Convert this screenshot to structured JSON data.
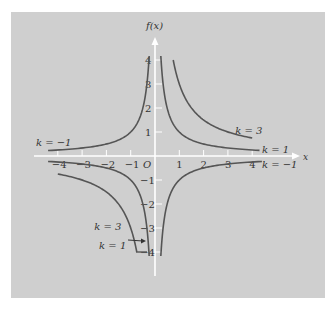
{
  "chart_data": {
    "type": "line",
    "title": "",
    "function": "f(x) = k/x",
    "xlabel": "x",
    "ylabel": "f(x)",
    "xlim": [
      -4.5,
      5.5
    ],
    "ylim": [
      -4.8,
      5.0
    ],
    "grid": false,
    "x_ticks": [
      -4,
      -3,
      -2,
      -1,
      1,
      2,
      3,
      4
    ],
    "x_tick_labels": [
      "−4",
      "−3",
      "−2",
      "−1",
      "1",
      "2",
      "3",
      "4"
    ],
    "y_ticks": [
      4,
      3,
      2,
      1,
      -1,
      -2,
      -3,
      -4
    ],
    "y_tick_labels": [
      "4",
      "3",
      "2",
      "1",
      "−1",
      "−2",
      "−3",
      "−4"
    ],
    "origin_label": "O",
    "series": [
      {
        "name": "k = 1",
        "k": 1,
        "branch": "x>0",
        "x_range": [
          0.24,
          4.3
        ]
      },
      {
        "name": "k = 3",
        "k": 3,
        "branch": "x>0",
        "x_range": [
          0.75,
          4.0
        ]
      },
      {
        "name": "k = -1",
        "k": -1,
        "branch": "x<0",
        "x_range": [
          -4.4,
          -0.24
        ]
      },
      {
        "name": "k = 1",
        "k": 1,
        "branch": "x<0",
        "x_range": [
          -4.4,
          -0.24
        ]
      },
      {
        "name": "k = 3",
        "k": 3,
        "branch": "x<0",
        "x_range": [
          -4.0,
          -0.75
        ]
      },
      {
        "name": "k = -1",
        "k": -1,
        "branch": "x>0",
        "x_range": [
          0.24,
          4.4
        ]
      }
    ],
    "annotations": [
      {
        "text": "k = −1",
        "x": -4.9,
        "y": 0.6
      },
      {
        "text": "k = 3",
        "x": 3.3,
        "y": 1.1
      },
      {
        "text": "k = 1",
        "x": 4.4,
        "y": 0.3
      },
      {
        "text": "k = −1",
        "x": 4.4,
        "y": -0.35
      },
      {
        "text": "k = 3",
        "x": -2.5,
        "y": -2.9
      },
      {
        "text": "k = 1",
        "x": -2.3,
        "y": -3.7
      }
    ]
  },
  "colors": {
    "panel": "#cfcfcf",
    "curve": "#555555",
    "axis": "#ffffff",
    "text": "#333333"
  },
  "labels": {
    "y_axis": "f(x)",
    "x_axis": "x",
    "origin": "O"
  }
}
